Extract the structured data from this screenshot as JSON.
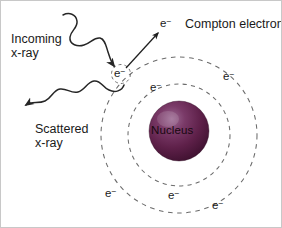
{
  "figure": {
    "width": 282,
    "height": 228,
    "background_color": "#ffffff",
    "border_color": "#c8c8c8"
  },
  "colors": {
    "ink": "#1a1a1a",
    "orbit_dash": "#6b6b6b",
    "nucleus_dark": "#3d1230",
    "nucleus_mid": "#6b2350",
    "nucleus_light": "#9c6a93",
    "wave_line": "#2b2b2b"
  },
  "atom": {
    "nucleus": {
      "label": "Nucleus",
      "center_x": 178,
      "center_y": 130,
      "radius": 30
    },
    "orbits": [
      {
        "name": "inner-shell",
        "center_x": 178,
        "center_y": 134,
        "radius": 51
      },
      {
        "name": "outer-shell",
        "center_x": 178,
        "center_y": 134,
        "radius": 78
      }
    ],
    "electrons": [
      {
        "id": "inner-top",
        "symbol": "e",
        "charge": "−",
        "x": 149,
        "y": 80,
        "shell": "inner"
      },
      {
        "id": "inner-bottom",
        "symbol": "e",
        "charge": "−",
        "x": 167,
        "y": 188,
        "shell": "inner"
      },
      {
        "id": "outer-top-right",
        "symbol": "e",
        "charge": "−",
        "x": 222,
        "y": 69,
        "shell": "outer"
      },
      {
        "id": "outer-left",
        "symbol": "e",
        "charge": "−",
        "x": 104,
        "y": 186,
        "shell": "outer"
      },
      {
        "id": "outer-bottom",
        "symbol": "e",
        "charge": "−",
        "x": 211,
        "y": 198,
        "shell": "outer"
      },
      {
        "id": "struck",
        "symbol": "e",
        "charge": "−",
        "x": 113,
        "y": 66,
        "shell": "outer"
      }
    ]
  },
  "annotations": {
    "incoming_xray": {
      "line1": "Incoming",
      "line2": "x-ray",
      "x": 10,
      "y": 31
    },
    "scattered_xray": {
      "line1": "Scattered",
      "line2": "x-ray",
      "x": 34,
      "y": 121
    },
    "compton_electron": {
      "electron_symbol": "e",
      "electron_charge": "−",
      "electron_x": 159,
      "electron_y": 16,
      "label": "Compton electron",
      "label_x": 184,
      "label_y": 16
    }
  }
}
